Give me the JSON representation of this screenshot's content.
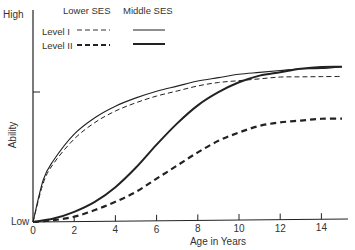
{
  "chart_data": {
    "type": "line",
    "title": "",
    "xlabel": "Age in Years",
    "ylabel": "Ability",
    "xlim": [
      0,
      15
    ],
    "ylim": [
      "Low",
      "High"
    ],
    "x_ticks": [
      0,
      2,
      4,
      6,
      8,
      10,
      12,
      14
    ],
    "y_tick_labels": {
      "low": "Low",
      "high": "High"
    },
    "grid": false,
    "legend": {
      "position": "top-left",
      "column_headers": [
        "Lower SES",
        "Middle SES"
      ],
      "row_labels": [
        "Level I",
        "Level II"
      ]
    },
    "series": [
      {
        "name": "Level I - Middle SES",
        "style": "solid-thin",
        "x": [
          0,
          0.5,
          1,
          2,
          3,
          4,
          5,
          6,
          7,
          8,
          9,
          10,
          11,
          12,
          13,
          14,
          15
        ],
        "y": [
          0,
          0.26,
          0.38,
          0.54,
          0.64,
          0.71,
          0.76,
          0.8,
          0.83,
          0.86,
          0.88,
          0.9,
          0.91,
          0.92,
          0.93,
          0.93,
          0.94
        ]
      },
      {
        "name": "Level I - Lower SES",
        "style": "dashed-thin",
        "x": [
          0,
          0.5,
          1,
          2,
          3,
          4,
          5,
          6,
          7,
          8,
          9,
          10,
          11,
          12,
          13,
          14,
          15
        ],
        "y": [
          0,
          0.24,
          0.36,
          0.51,
          0.61,
          0.68,
          0.73,
          0.77,
          0.8,
          0.83,
          0.85,
          0.86,
          0.87,
          0.88,
          0.88,
          0.88,
          0.88
        ]
      },
      {
        "name": "Level II - Middle SES",
        "style": "solid-thick",
        "x": [
          0,
          1,
          2,
          3,
          4,
          5,
          6,
          7,
          8,
          9,
          10,
          11,
          12,
          13,
          14,
          15
        ],
        "y": [
          0,
          0.02,
          0.06,
          0.12,
          0.21,
          0.33,
          0.47,
          0.6,
          0.71,
          0.79,
          0.85,
          0.89,
          0.91,
          0.93,
          0.94,
          0.94
        ]
      },
      {
        "name": "Level II - Lower SES",
        "style": "dashed-thick",
        "x": [
          0,
          1,
          2,
          3,
          4,
          5,
          6,
          7,
          8,
          9,
          10,
          11,
          12,
          13,
          14,
          15
        ],
        "y": [
          0,
          0.01,
          0.03,
          0.07,
          0.12,
          0.18,
          0.26,
          0.34,
          0.42,
          0.49,
          0.54,
          0.58,
          0.6,
          0.61,
          0.62,
          0.62
        ]
      }
    ]
  },
  "legend": {
    "lower_ses": "Lower SES",
    "middle_ses": "Middle SES",
    "level1": "Level I",
    "level2": "Level II"
  },
  "axes": {
    "high": "High",
    "low": "Low",
    "ylabel": "Ability",
    "xlabel": "Age in Years",
    "ticks": [
      "0",
      "2",
      "4",
      "6",
      "8",
      "10",
      "12",
      "14"
    ]
  }
}
